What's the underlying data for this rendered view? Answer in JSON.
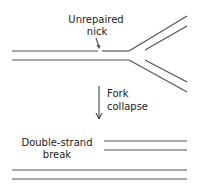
{
  "labels": {
    "nick_line1": "Unrepaired",
    "nick_line2": "nick",
    "fork_line1": "Fork",
    "fork_line2": "collapse",
    "dsb_line1": "Double-strand",
    "dsb_line2": "break"
  },
  "colors": {
    "stroke": "#555555",
    "text": "#222222",
    "background": "#ffffff"
  }
}
